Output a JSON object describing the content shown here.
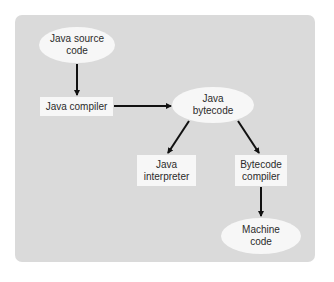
{
  "diagram": {
    "type": "flowchart",
    "title": "",
    "nodes": [
      {
        "id": "source",
        "shape": "ellipse",
        "line1": "Java source",
        "line2": "code"
      },
      {
        "id": "compiler",
        "shape": "box",
        "line1": "Java compiler"
      },
      {
        "id": "bytecode",
        "shape": "ellipse",
        "line1": "Java",
        "line2": "bytecode"
      },
      {
        "id": "interpreter",
        "shape": "box",
        "line1": "Java",
        "line2": "interpreter"
      },
      {
        "id": "bccompiler",
        "shape": "box",
        "line1": "Bytecode",
        "line2": "compiler"
      },
      {
        "id": "machine",
        "shape": "ellipse",
        "line1": "Machine",
        "line2": "code"
      }
    ],
    "edges": [
      {
        "from": "source",
        "to": "compiler"
      },
      {
        "from": "compiler",
        "to": "bytecode"
      },
      {
        "from": "bytecode",
        "to": "interpreter"
      },
      {
        "from": "bytecode",
        "to": "bccompiler"
      },
      {
        "from": "bccompiler",
        "to": "machine"
      }
    ],
    "colors": {
      "panel": "#dadada",
      "node_fill": "#f7f7f7",
      "arrow": "#111111",
      "text": "#2b2b2b"
    }
  }
}
